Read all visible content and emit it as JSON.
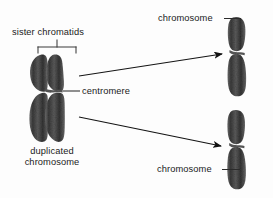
{
  "figure": {
    "background_color": "#fdfdfd",
    "ink_color": "#1b1b1b",
    "chromatin_color": "#4a4a4a"
  },
  "labels": {
    "sister_chromatids": "sister chromatids",
    "centromere": "centromere",
    "duplicated_chromosome_line1": "duplicated",
    "duplicated_chromosome_line2": "chromosome",
    "chromosome_top": "chromosome",
    "chromosome_bottom": "chromosome"
  },
  "structures": {
    "duplicated_chromosome": {
      "name": "duplicated chromosome",
      "chromatid_count": 2,
      "centromere_y": 91
    },
    "chromosome_top": {
      "name": "chromosome",
      "chromatid_count": 1
    },
    "chromosome_bottom": {
      "name": "chromosome",
      "chromatid_count": 1
    }
  },
  "connectors": {
    "bracket": "sister chromatids bracket",
    "centromere_leader": "centromere leader line",
    "arrow_top": "arrow to top chromosome",
    "arrow_bottom": "arrow to bottom chromosome",
    "leader_top": "leader to top chromosome",
    "leader_bottom": "leader to bottom chromosome"
  }
}
